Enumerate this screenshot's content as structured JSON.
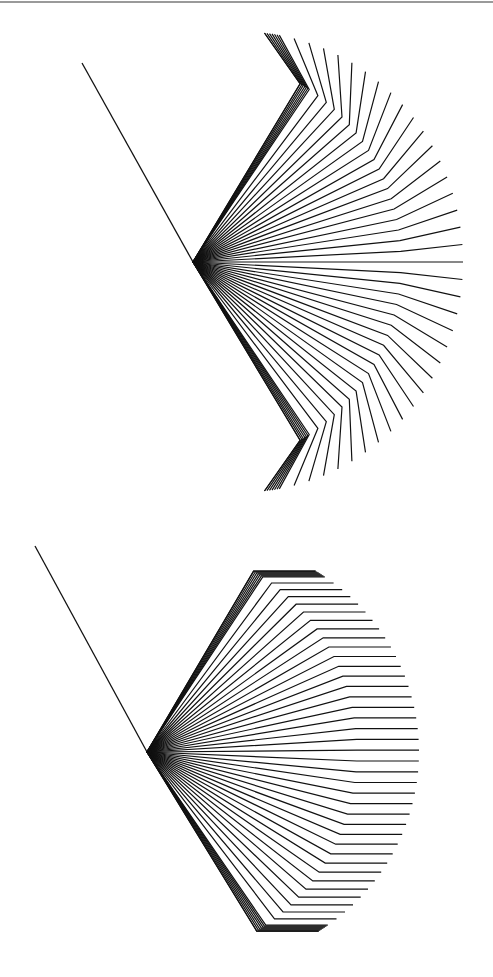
{
  "page": {
    "width": 493,
    "height": 977,
    "background": "#ffffff",
    "rule_color": "#9a9a9a",
    "line_color": "#111111"
  },
  "figures": [
    {
      "id": "fan-reflected",
      "description": "Ray fan whose rays bend outward at a fixed radius (second segment angle proportional to ray angle)",
      "incident_line": {
        "from": [
          82,
          63
        ],
        "to": [
          193,
          262
        ]
      },
      "apex": [
        193,
        262
      ],
      "ray_count": 41,
      "angle_min_deg": -59,
      "angle_max_deg": 59,
      "bend_radius": 208,
      "tail_length": 62,
      "bend_mode": "rotate",
      "bend_factor": 2.12
    },
    {
      "id": "fan-collimated",
      "description": "Ray fan whose rays bend to horizontal at a fixed radius",
      "incident_line": {
        "from": [
          35,
          546
        ],
        "to": [
          147,
          752
        ]
      },
      "apex": [
        147,
        752
      ],
      "ray_count": 41,
      "angle_min_deg": -59.5,
      "angle_max_deg": 58.5,
      "bend_radius": 210,
      "tail_length": 62,
      "bend_mode": "horizontal",
      "bend_factor": 0
    }
  ]
}
